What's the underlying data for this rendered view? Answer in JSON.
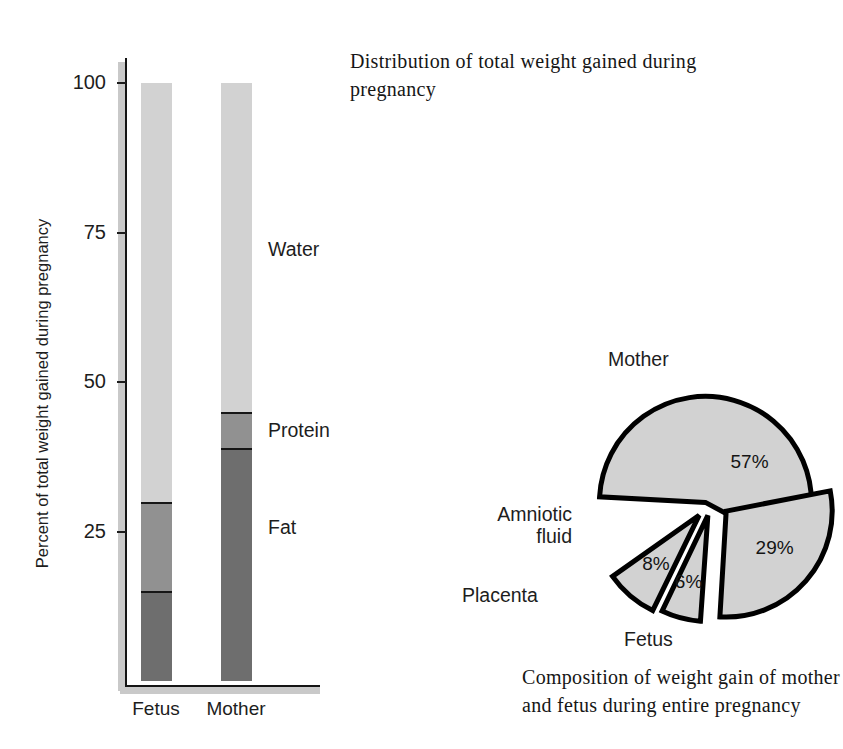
{
  "chart_data": [
    {
      "type": "bar",
      "subtype": "stacked-100-percent",
      "title": "Distribution of total weight gained during pregnancy",
      "xlabel": "",
      "ylabel": "Percent of total weight gained during pregnancy",
      "ylim": [
        0,
        100
      ],
      "yticks": [
        25,
        50,
        75,
        100
      ],
      "ytick_labels": [
        "25",
        "50",
        "75",
        "100"
      ],
      "grid": false,
      "legend": "inline-annotations",
      "categories": [
        "Fetus",
        "Mother"
      ],
      "series": [
        {
          "name": "Fat",
          "values": [
            15,
            39
          ],
          "color": "#6e6e6e"
        },
        {
          "name": "Protein",
          "values": [
            15,
            6
          ],
          "color": "#919191"
        },
        {
          "name": "Water",
          "values": [
            70,
            55
          ],
          "color": "#d2d2d2"
        }
      ],
      "annotations": [
        {
          "text": "Water",
          "series": "Water"
        },
        {
          "text": "Protein",
          "series": "Protein"
        },
        {
          "text": "Fat",
          "series": "Fat"
        }
      ]
    },
    {
      "type": "pie",
      "title": "",
      "caption": "Composition of weight gain of mother and fetus during entire pregnancy",
      "exploded": true,
      "labels": [
        "Mother",
        "Fetus",
        "Placenta",
        "Amniotic fluid"
      ],
      "values": [
        57,
        29,
        6,
        8
      ],
      "value_labels": [
        "57%",
        "29%",
        "6%",
        "8%"
      ],
      "slice_color": "#d2d2d2",
      "outline_color": "#000000"
    }
  ],
  "bar_chart": {
    "axis_title": "Percent of total weight gained during pregnancy",
    "ticks": [
      {
        "label": "100",
        "value": 100
      },
      {
        "label": "75",
        "value": 75
      },
      {
        "label": "50",
        "value": 50
      },
      {
        "label": "25",
        "value": 25
      }
    ],
    "bars": [
      {
        "category": "Fetus",
        "segments": [
          {
            "name": "Water",
            "value": 70
          },
          {
            "name": "Protein",
            "value": 15
          },
          {
            "name": "Fat",
            "value": 15
          }
        ]
      },
      {
        "category": "Mother",
        "segments": [
          {
            "name": "Water",
            "value": 55
          },
          {
            "name": "Protein",
            "value": 6
          },
          {
            "name": "Fat",
            "value": 39
          }
        ]
      }
    ],
    "segment_labels": {
      "water": "Water",
      "protein": "Protein",
      "fat": "Fat"
    }
  },
  "headings": {
    "chart_title": "Distribution of total weight gained during pregnancy",
    "pie_caption": "Composition of weight gain of mother and fetus during entire pregnancy"
  },
  "pie_chart": {
    "slices": [
      {
        "label": "Mother",
        "value_label": "57%",
        "value": 57
      },
      {
        "label": "Fetus",
        "value_label": "29%",
        "value": 29
      },
      {
        "label": "Placenta",
        "value_label": "6%",
        "value": 6
      },
      {
        "label": "Amniotic fluid",
        "value_label": "8%",
        "value": 8
      }
    ],
    "labels": {
      "mother": "Mother",
      "fetus": "Fetus",
      "placenta": "Placenta",
      "amniotic_fluid": "Amniotic\nfluid"
    },
    "values": {
      "mother": "57%",
      "fetus": "29%",
      "placenta": "6%",
      "amniotic_fluid": "8%"
    }
  },
  "colors": {
    "water": "#d2d2d2",
    "protein": "#919191",
    "fat": "#6e6e6e",
    "pie_fill": "#d2d2d2",
    "outline": "#000000",
    "text": "#1d1d1d"
  }
}
